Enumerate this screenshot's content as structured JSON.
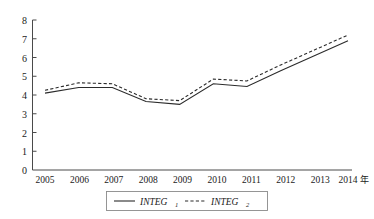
{
  "chart_data": {
    "type": "line",
    "title": "",
    "xlabel": "年",
    "ylabel": "",
    "x": [
      2005,
      2006,
      2007,
      2008,
      2009,
      2010,
      2011,
      2012,
      2013,
      2014
    ],
    "categories": [
      "2005",
      "2006",
      "2007",
      "2008",
      "2009",
      "2010",
      "2011",
      "2012",
      "2013",
      "2014"
    ],
    "series": [
      {
        "name": "INTEG",
        "subscript": "1",
        "style": "solid",
        "values": [
          4.1,
          4.4,
          4.4,
          3.65,
          3.5,
          4.6,
          4.45,
          5.3,
          6.1,
          6.9
        ]
      },
      {
        "name": "INTEG",
        "subscript": "2",
        "style": "dashed",
        "values": [
          4.25,
          4.65,
          4.6,
          3.8,
          3.7,
          4.85,
          4.75,
          5.6,
          6.4,
          7.2
        ]
      }
    ],
    "ylim": [
      0,
      8
    ],
    "yticks": [
      "0",
      "1",
      "2",
      "3",
      "4",
      "5",
      "6",
      "7",
      "8"
    ],
    "xlim": [
      2005,
      2014
    ],
    "grid": false,
    "legend_position": "bottom-center",
    "line_color": "#2b2b2b",
    "axis_color": "#4a4a4a"
  },
  "legend": {
    "entries": [
      {
        "label": "INTEG",
        "subscript": "1",
        "style": "solid"
      },
      {
        "label": "INTEG",
        "subscript": "2",
        "style": "dashed"
      }
    ]
  }
}
